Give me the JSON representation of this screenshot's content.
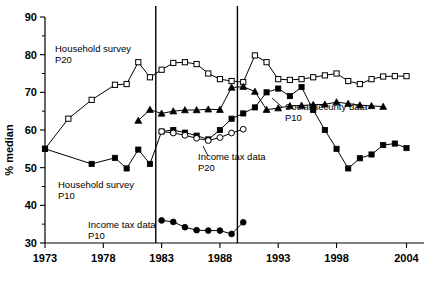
{
  "chart_data": {
    "type": "line",
    "title": "",
    "xlabel": "",
    "ylabel": "% median",
    "xlim": [
      1973,
      2005.5
    ],
    "ylim": [
      30,
      90
    ],
    "grid": false,
    "legend_position": "inline-annotations",
    "xticks": [
      1973,
      1978,
      1983,
      1988,
      1993,
      1998,
      2004
    ],
    "xtick_labels": [
      "1973",
      "1978",
      "1983",
      "1988",
      "1993",
      "1998",
      "2004"
    ],
    "yticks": [
      30,
      40,
      50,
      60,
      70,
      80,
      90
    ],
    "ytick_labels": [
      "30",
      "40",
      "50",
      "60",
      "70",
      "80",
      "90"
    ],
    "yticks_minor": [
      35,
      45,
      55,
      65,
      75,
      85
    ],
    "vertical_reference_lines": [
      1982.5,
      1989.5
    ],
    "series": [
      {
        "name": "Household survey P20",
        "marker": "open-square",
        "x": [
          1973,
          1975,
          1977,
          1979,
          1980,
          1981,
          1982,
          1983,
          1984,
          1985,
          1986,
          1987,
          1988,
          1989,
          1990,
          1991,
          1992,
          1993,
          1994,
          1995,
          1996,
          1997,
          1998,
          1999,
          2000,
          2001,
          2002,
          2003,
          2004
        ],
        "values": [
          55.0,
          63.0,
          68.0,
          72.0,
          72.2,
          78.0,
          74.0,
          76.0,
          77.8,
          78.0,
          77.5,
          75.0,
          73.5,
          73.0,
          72.7,
          79.8,
          78.0,
          73.5,
          73.3,
          73.5,
          74.0,
          74.5,
          75.0,
          73.0,
          72.2,
          73.5,
          74.2,
          74.3,
          74.3
        ]
      },
      {
        "name": "Household survey P10",
        "marker": "filled-square",
        "x": [
          1973,
          1977,
          1979,
          1980,
          1981,
          1982,
          1983,
          1984,
          1985,
          1986,
          1987,
          1988,
          1989,
          1990,
          1991,
          1992,
          1993,
          1994,
          1995,
          1996,
          1997,
          1998,
          1999,
          2000,
          2001,
          2002,
          2003,
          2004
        ],
        "values": [
          55.0,
          51.0,
          52.6,
          49.8,
          54.8,
          51.0,
          59.6,
          60.0,
          59.3,
          58.5,
          57.5,
          60.0,
          63.0,
          64.4,
          66.0,
          70.0,
          71.0,
          69.0,
          71.4,
          65.3,
          60.0,
          55.0,
          49.8,
          52.5,
          53.5,
          56.0,
          56.4,
          55.2
        ]
      },
      {
        "name": "Income tax data P20",
        "marker": "open-circle",
        "x": [
          1983,
          1984,
          1985,
          1986,
          1987,
          1988,
          1989,
          1990
        ],
        "values": [
          59.6,
          59.2,
          58.6,
          57.8,
          57.2,
          58.0,
          59.2,
          60.2
        ]
      },
      {
        "name": "Social security data P10",
        "marker": "filled-triangle",
        "x": [
          1981,
          1982,
          1983,
          1984,
          1985,
          1986,
          1987,
          1988,
          1989,
          1990,
          1991,
          1992,
          1993,
          1994,
          1995,
          1996,
          1997,
          1998,
          1999,
          2000,
          2001,
          2002
        ],
        "values": [
          62.5,
          65.4,
          64.4,
          65.0,
          65.3,
          65.3,
          65.5,
          65.4,
          71.3,
          71.5,
          70.2,
          65.4,
          65.8,
          66.4,
          66.5,
          66.7,
          66.8,
          67.4,
          67.0,
          66.6,
          66.4,
          66.2
        ]
      },
      {
        "name": "Income tax data P10",
        "marker": "filled-circle",
        "x": [
          1983,
          1984,
          1985,
          1986,
          1987,
          1988,
          1989,
          1990
        ],
        "values": [
          36.0,
          35.6,
          34.2,
          33.4,
          33.3,
          33.3,
          32.4,
          35.5
        ]
      }
    ],
    "annotations": [
      {
        "id": "anno-household-p20",
        "line1": "Household survey",
        "line2": "P20"
      },
      {
        "id": "anno-household-p10",
        "line1": "Household survey",
        "line2": "P10"
      },
      {
        "id": "anno-social-security-p10",
        "line1": "Social security data",
        "line2": "P10"
      },
      {
        "id": "anno-income-tax-p20",
        "line1": "Income tax data",
        "line2": "P20"
      },
      {
        "id": "anno-income-tax-p10",
        "line1": "Income tax data",
        "line2": "P10"
      }
    ]
  }
}
